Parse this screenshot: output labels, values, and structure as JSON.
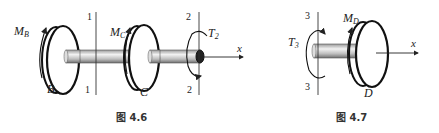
{
  "figures": [
    {
      "caption": "图 4.6",
      "labels": {
        "moment_b": "M",
        "moment_b_sub": "B",
        "moment_c": "M",
        "moment_c_sub": "C",
        "torque": "T",
        "torque_sub": "2",
        "disc_b": "B",
        "disc_c": "C",
        "section1_top": "1",
        "section1_bottom": "1",
        "section2_top": "2",
        "section2_bottom": "2",
        "axis": "x"
      }
    },
    {
      "caption": "图 4.7",
      "labels": {
        "moment_d": "M",
        "moment_d_sub": "D",
        "torque": "T",
        "torque_sub": "3",
        "disc_d": "D",
        "section3_top": "3",
        "section3_bottom": "3",
        "axis": "x"
      }
    }
  ]
}
